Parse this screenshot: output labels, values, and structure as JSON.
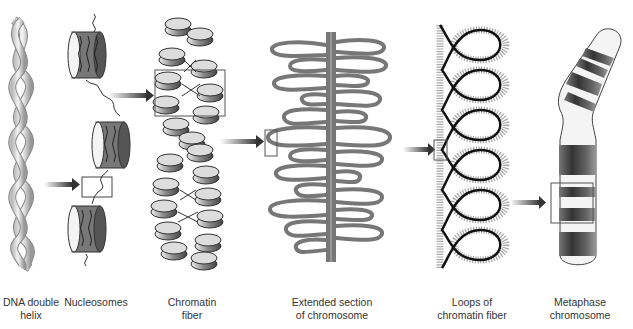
{
  "diagram": {
    "type": "chromatin packing levels",
    "stages": [
      {
        "id": "dna",
        "label_line1": "DNA double",
        "label_line2": "helix"
      },
      {
        "id": "nucleosomes",
        "label_line1": "Nucleosomes",
        "label_line2": ""
      },
      {
        "id": "chromatin",
        "label_line1": "Chromatin",
        "label_line2": "fiber"
      },
      {
        "id": "extended",
        "label_line1": "Extended section",
        "label_line2": "of chromosome"
      },
      {
        "id": "loops",
        "label_line1": "Loops of",
        "label_line2": "chromatin fiber"
      },
      {
        "id": "metaphase",
        "label_line1": "Metaphase",
        "label_line2": "chromosome"
      }
    ],
    "colors": {
      "outline": "#333333",
      "fill_light": "#f2f2f2",
      "fill_dark": "#555555",
      "arrow": "#444444"
    }
  }
}
